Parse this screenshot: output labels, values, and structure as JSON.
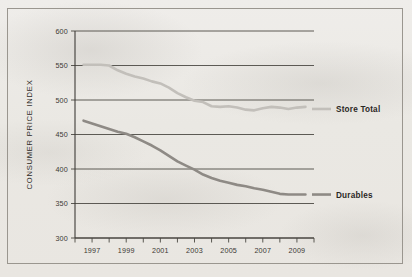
{
  "figure": {
    "border_color": "#9a968f",
    "background_color": "#eceae6"
  },
  "chart_data": {
    "type": "line",
    "title": "",
    "xlabel": "",
    "ylabel": "CONSUMER PRICE INDEX",
    "xlim": [
      1996,
      2010
    ],
    "ylim": [
      300,
      600
    ],
    "grid": true,
    "grid_axis": "y",
    "legend_position": "inline-right",
    "y_ticks": [
      300,
      350,
      400,
      450,
      500,
      550,
      600
    ],
    "y_tick_labels": [
      "300",
      "350",
      "400",
      "450",
      "500",
      "550",
      "600"
    ],
    "x_ticks": [
      1996,
      1997,
      1998,
      1999,
      2000,
      2001,
      2002,
      2003,
      2004,
      2005,
      2006,
      2007,
      2008,
      2009,
      2010
    ],
    "x_tick_labels": [
      "",
      "1997",
      "",
      "1999",
      "",
      "2001",
      "",
      "2003",
      "",
      "2005",
      "",
      "2007",
      "",
      "2009",
      ""
    ],
    "x": [
      1996.5,
      1997,
      1997.5,
      1998,
      1998.5,
      1999,
      1999.5,
      2000,
      2000.5,
      2001,
      2001.5,
      2002,
      2002.5,
      2003,
      2003.5,
      2004,
      2004.5,
      2005,
      2005.5,
      2006,
      2006.5,
      2007,
      2007.5,
      2008,
      2008.5,
      2009,
      2009.5
    ],
    "series": [
      {
        "name": "Store Total",
        "color": "#c2bfba",
        "line_width": 2.6,
        "label": "Store Total",
        "label_x": 2010.2,
        "label_y": 487,
        "values": [
          551,
          551,
          551,
          550,
          543,
          538,
          534,
          531,
          527,
          524,
          518,
          510,
          504,
          499,
          497,
          491,
          490,
          491,
          489,
          486,
          485,
          488,
          490,
          489,
          487,
          489,
          490
        ]
      },
      {
        "name": "Durables",
        "color": "#8e8a85",
        "line_width": 2.6,
        "label": "Durables",
        "label_x": 2010.2,
        "label_y": 363,
        "values": [
          470,
          466,
          462,
          458,
          454,
          451,
          446,
          440,
          434,
          427,
          419,
          411,
          405,
          399,
          392,
          387,
          383,
          380,
          377,
          375,
          372,
          370,
          367,
          364,
          363,
          363,
          363
        ]
      }
    ]
  }
}
